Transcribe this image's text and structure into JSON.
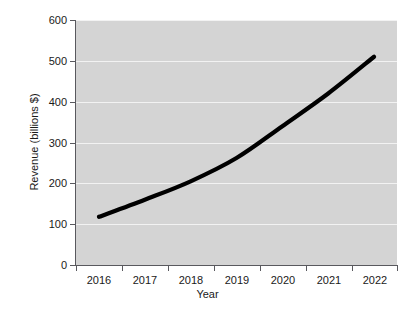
{
  "chart_data": {
    "type": "line",
    "title": "",
    "xlabel": "Year",
    "ylabel": "Revenue (billions $)",
    "categories": [
      "2016",
      "2017",
      "2018",
      "2019",
      "2020",
      "2021",
      "2022"
    ],
    "values": [
      118,
      160,
      205,
      262,
      340,
      420,
      510
    ],
    "series": [
      {
        "name": "Revenue",
        "values": [
          118,
          160,
          205,
          262,
          340,
          420,
          510
        ]
      }
    ],
    "ylim": [
      0,
      600
    ],
    "y_ticks": [
      "0",
      "100",
      "200",
      "300",
      "400",
      "500",
      "600"
    ],
    "x_ticks": [
      "2016",
      "2017",
      "2018",
      "2019",
      "2020",
      "2021",
      "2022"
    ],
    "grid": "horizontal",
    "legend": "none",
    "line_color": "#000000",
    "plot_background": "#d4d4d4",
    "gridline_color": "#f2f2f2",
    "figure_background": "#ffffff"
  },
  "axes": {
    "y_title": "Revenue (billions $)",
    "x_title": "Year",
    "y_labels": [
      "600",
      "500",
      "400",
      "300",
      "200",
      "100",
      "0"
    ],
    "x_labels": [
      "2016",
      "2017",
      "2018",
      "2019",
      "2020",
      "2021",
      "2022"
    ]
  }
}
